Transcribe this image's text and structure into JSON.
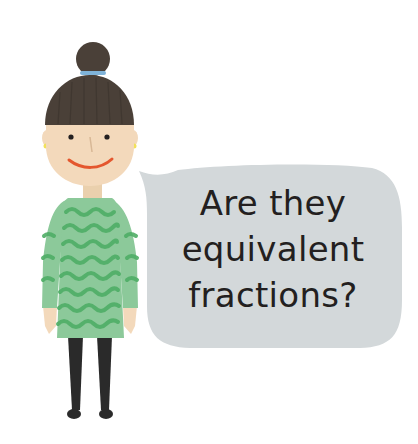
{
  "speech_bubble": {
    "lines": [
      "Are they",
      "equivalent",
      "fractions?"
    ]
  },
  "colors": {
    "background": "#ffffff",
    "hair": "#4a4038",
    "hair_band": "#7fb3d8",
    "skin": "#f3d9bb",
    "eyes": "#231f20",
    "smile": "#e4572e",
    "earring": "#f2e15a",
    "sweater": "#8cc99a",
    "sweater_wave": "#4fae66",
    "leggings": "#2a2a2a",
    "bubble": "#d3d8da",
    "text": "#231f20"
  }
}
